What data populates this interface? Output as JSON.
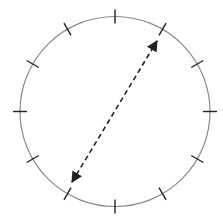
{
  "diagram": {
    "circle": {
      "cx": 115,
      "cy": 111.5,
      "r": 95,
      "stroke": "#8a8a8a"
    },
    "ticks": {
      "count": 12,
      "length": 14,
      "stroke": "#222222"
    },
    "arrow": {
      "style": "dashed",
      "heads": "both",
      "from_clock": 7,
      "to_clock": 1,
      "start": [
        72,
        182
      ],
      "end": [
        157,
        41
      ],
      "stroke": "#222222"
    }
  }
}
